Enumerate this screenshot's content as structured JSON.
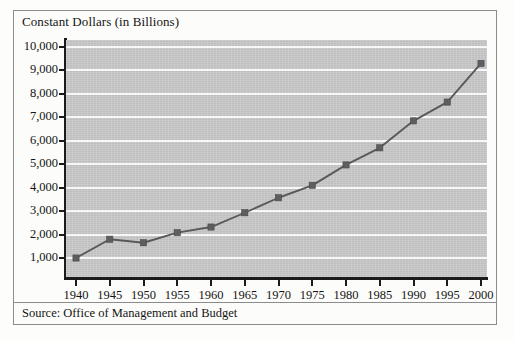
{
  "figure": {
    "title": "Constant Dollars (in Billions)",
    "source_note": "Source: Office of Management and Budget"
  },
  "chart_data": {
    "type": "line",
    "title": "Constant Dollars (in Billions)",
    "xlabel": "",
    "ylabel": "Constant Dollars (in Billions)",
    "categories": [
      "1940",
      "1945",
      "1950",
      "1955",
      "1960",
      "1965",
      "1970",
      "1975",
      "1980",
      "1985",
      "1990",
      "1995",
      "2000"
    ],
    "x": [
      1940,
      1945,
      1950,
      1955,
      1960,
      1965,
      1970,
      1975,
      1980,
      1985,
      1990,
      1995,
      2000
    ],
    "values": [
      1000,
      1800,
      1650,
      2080,
      2320,
      2930,
      3570,
      4100,
      4970,
      5700,
      6850,
      7650,
      9300
    ],
    "ylim": [
      0,
      10500
    ],
    "xlim": [
      1937.5,
      2002.5
    ],
    "yticks": [
      1000,
      2000,
      3000,
      4000,
      5000,
      6000,
      7000,
      8000,
      9000,
      10000
    ],
    "ytick_labels": [
      "1,000",
      "2,000",
      "3,000",
      "4,000",
      "5,000",
      "6,000",
      "7,000",
      "8,000",
      "9,000",
      "10,000"
    ],
    "xticks": [
      1940,
      1945,
      1950,
      1955,
      1960,
      1965,
      1970,
      1975,
      1980,
      1985,
      1990,
      1995,
      2000
    ],
    "xtick_labels": [
      "1940",
      "1945",
      "1950",
      "1955",
      "1960",
      "1965",
      "1970",
      "1975",
      "1980",
      "1985",
      "1990",
      "1995",
      "2000"
    ],
    "grid": "horizontal",
    "legend": "none",
    "marker": "square",
    "colors": {
      "plot_background": "#c9c9c9",
      "gridline": "#f7f7f7",
      "line": "#59595c",
      "marker": "#5e5e61",
      "axis": "#1b1b1b",
      "text": "#141414",
      "frame": "#8c8c8c",
      "page_background": "#fdfdfb"
    }
  }
}
